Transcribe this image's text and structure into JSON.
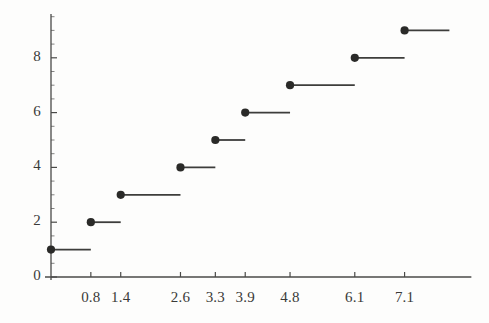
{
  "chart_data": {
    "type": "line",
    "subtype": "step-function-empirical-cdf",
    "title": "",
    "subtitle": "",
    "xlabel": "",
    "ylabel": "",
    "xlim": [
      0,
      8.2
    ],
    "ylim": [
      0,
      9.6
    ],
    "grid": false,
    "legend": null,
    "annotations": [],
    "x_tick_labels": [
      "0.8",
      "1.4",
      "2.6",
      "3.3",
      "3.9",
      "4.8",
      "6.1",
      "7.1"
    ],
    "x_ticks": [
      0.8,
      1.4,
      2.6,
      3.3,
      3.9,
      4.8,
      6.1,
      7.1
    ],
    "y_tick_labels": [
      "0",
      "2",
      "4",
      "6",
      "8"
    ],
    "y_ticks": [
      0,
      2,
      4,
      6,
      8
    ],
    "y_minor_tick_step": 0.5,
    "series": [
      {
        "name": "step",
        "marker": "filled-circle",
        "line_color": "#3d3d3b",
        "marker_color": "#2a2a28",
        "steps": [
          {
            "x_start": 0.0,
            "x_end": 0.8,
            "y": 1,
            "dot_x": 0.0
          },
          {
            "x_start": 0.8,
            "x_end": 1.4,
            "y": 2,
            "dot_x": 0.8
          },
          {
            "x_start": 1.4,
            "x_end": 2.6,
            "y": 3,
            "dot_x": 1.4
          },
          {
            "x_start": 2.6,
            "x_end": 3.3,
            "y": 4,
            "dot_x": 2.6
          },
          {
            "x_start": 3.3,
            "x_end": 3.9,
            "y": 5,
            "dot_x": 3.3
          },
          {
            "x_start": 3.9,
            "x_end": 4.8,
            "y": 6,
            "dot_x": 3.9
          },
          {
            "x_start": 4.8,
            "x_end": 6.1,
            "y": 7,
            "dot_x": 4.8
          },
          {
            "x_start": 6.1,
            "x_end": 7.1,
            "y": 8,
            "dot_x": 6.1
          },
          {
            "x_start": 7.1,
            "x_end": 8.0,
            "y": 9,
            "dot_x": 7.1
          }
        ],
        "x_values": [
          0.0,
          0.8,
          1.4,
          2.6,
          3.3,
          3.9,
          4.8,
          6.1,
          7.1
        ],
        "y_values": [
          1,
          2,
          3,
          4,
          5,
          6,
          7,
          8,
          9
        ]
      }
    ]
  },
  "colors": {
    "background": "#fdfdfc",
    "axis": "#4a4a48",
    "line": "#3d3d3b",
    "marker": "#2a2a28",
    "text": "#3a3a38"
  },
  "axes": {
    "x_axis_name": "x-axis",
    "y_axis_name": "y-axis"
  }
}
